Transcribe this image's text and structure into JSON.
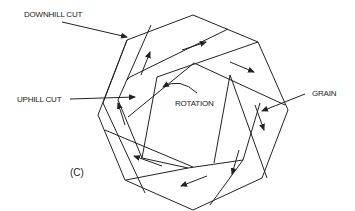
{
  "figure": {
    "type": "octagonal cutting-board joinery diagram",
    "labels": {
      "downhill_cut": "DOWNHILL CUT",
      "uphill_cut": "UPHILL CUT",
      "rotation": "ROTATION",
      "grain": "GRAIN",
      "panel": "(C)"
    },
    "colors": {
      "line": "#222222",
      "background": "#ffffff"
    },
    "segments_count": 8
  }
}
